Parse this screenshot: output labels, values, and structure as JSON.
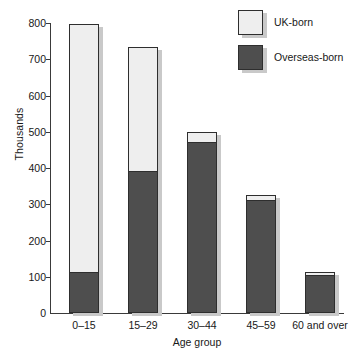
{
  "chart_data": {
    "type": "bar",
    "stacked": true,
    "title": "",
    "subtitle": "",
    "xlabel": "Age group",
    "ylabel": "Thousands",
    "ylim": [
      0,
      800
    ],
    "ytick_values": [
      0,
      100,
      200,
      300,
      400,
      500,
      600,
      700,
      800
    ],
    "ytick_labels": [
      "0",
      "100",
      "200",
      "300",
      "400",
      "500",
      "600",
      "700",
      "800"
    ],
    "grid": false,
    "legend_position": "top-right",
    "categories": [
      "0–15",
      "15–29",
      "30–44",
      "45–59",
      "60 and over"
    ],
    "series": [
      {
        "name": "Overseas-born",
        "color": "#4e4e4e",
        "values": [
          110,
          390,
          470,
          310,
          103
        ]
      },
      {
        "name": "UK-born",
        "color": "#eeeeee",
        "values": [
          688,
          345,
          30,
          15,
          9
        ]
      }
    ],
    "totals": [
      798,
      735,
      500,
      325,
      112
    ],
    "annotations": []
  },
  "legend": {
    "items": [
      {
        "label": "UK-born",
        "swatch": "light"
      },
      {
        "label": "Overseas-born",
        "swatch": "dark"
      }
    ]
  },
  "colors": {
    "uk_born_fill": "#eeeeee",
    "overseas_born_fill": "#4e4e4e",
    "outline": "#2e2e2e",
    "shadow": "#c9c9c9",
    "axis": "#3a3a3a",
    "text": "#181818",
    "background": "#ffffff"
  }
}
